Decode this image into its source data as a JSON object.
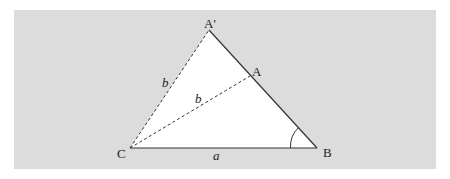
{
  "figure": {
    "background_color": "#dcdcdc",
    "triangle_fill": "#ffffff",
    "line_color": "#333333",
    "points": {
      "A_prime": {
        "label": "A'",
        "x": 209,
        "y": 30
      },
      "A": {
        "label": "A",
        "x": 250,
        "y": 77
      },
      "B": {
        "label": "B",
        "x": 317,
        "y": 148
      },
      "C": {
        "label": "C",
        "x": 130,
        "y": 148
      }
    },
    "labels": {
      "side_a": "a",
      "side_b_outer": "b",
      "side_b_inner": "b",
      "vertex_A_prime": "A'",
      "vertex_A": "A",
      "vertex_B": "B",
      "vertex_C": "C"
    },
    "angle_marker": "angle at B"
  }
}
